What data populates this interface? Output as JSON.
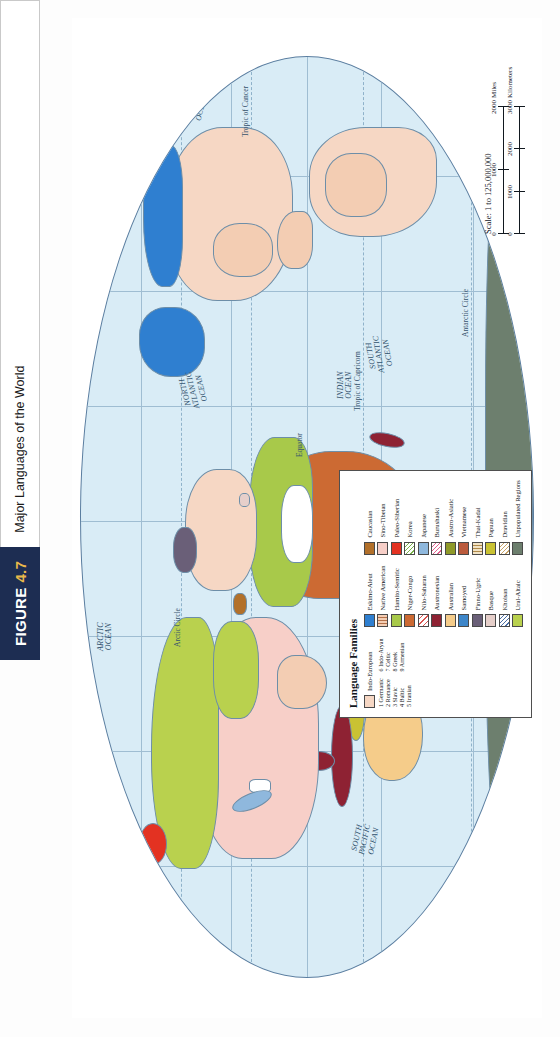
{
  "figure": {
    "tag_word": "FIGURE",
    "tag_number": "4.7",
    "caption": "Major Languages of the World"
  },
  "map": {
    "projection_note": "oval world projection",
    "ocean_labels": [
      {
        "name": "north-pacific-ocean-west",
        "text": "NORTH\nPACIFIC\nOCEAN",
        "x": 155,
        "y": 40
      },
      {
        "name": "arctic-ocean",
        "text": "ARCTIC\nOCEAN",
        "x": 348,
        "y": 22
      },
      {
        "name": "north-atlantic-ocean",
        "text": "NORTH\nATLANTIC\nOCEAN",
        "x": 592,
        "y": 108
      },
      {
        "name": "north-pacific-ocean-east",
        "text": "NORTH\nPACIFIC\nOCEAN",
        "x": 823,
        "y": 104
      },
      {
        "name": "indian-ocean",
        "text": "INDIAN\nOCEAN",
        "x": 300,
        "y": 262
      },
      {
        "name": "south-pacific-ocean",
        "text": "SOUTH\nPACIFIC\nOCEAN",
        "x": 138,
        "y": 276
      },
      {
        "name": "south-atlantic-ocean",
        "text": "SOUTH\nATLANTIC\nOCEAN",
        "x": 512,
        "y": 276
      }
    ],
    "lines": [
      {
        "name": "arctic-circle",
        "text": "Arctic Circle",
        "x": 318,
        "y": 108
      },
      {
        "name": "tropic-of-cancer",
        "text": "Tropic of Cancer",
        "x": 175,
        "y": 172
      },
      {
        "name": "equator",
        "text": "Equator",
        "x": 347,
        "y": 222
      },
      {
        "name": "tropic-of-capricorn",
        "text": "Tropic of Capricorn",
        "x": 247,
        "y": 272
      },
      {
        "name": "antarctic-circle",
        "text": "Antarctic Circle",
        "x": 197,
        "y": 392
      }
    ]
  },
  "scale": {
    "statement": "Scale: 1 to 125,000,000",
    "miles": {
      "unit": "Miles",
      "ticks": [
        "0",
        "1000",
        "2000"
      ]
    },
    "kilometers": {
      "unit": "Kilometers",
      "ticks": [
        "0",
        "1000",
        "2000",
        "3000"
      ]
    }
  },
  "legend": {
    "title": "Language Families",
    "column1": [
      {
        "label": "Indo-European",
        "color": "#f6d7c4",
        "pattern": "solid"
      }
    ],
    "indo_european_numbered": {
      "left": [
        "1  Germanic",
        "2  Romance",
        "3  Slavic",
        "4  Baltic",
        "5  Iranian"
      ],
      "right": [
        "6  Indo-Aryan",
        "7  Celtic",
        "8  Greek",
        "9  Armenian"
      ]
    },
    "column2": [
      {
        "label": "Eskimo-Aleut",
        "color": "#2f7fd0",
        "pattern": "solid"
      },
      {
        "label": "Native American",
        "color": "#f3cdb3",
        "pattern": "vstripe"
      },
      {
        "label": "Hamito-Semitic",
        "color": "#a8c94a",
        "pattern": "solid"
      },
      {
        "label": "Niger-Congo",
        "color": "#cc6a33",
        "pattern": "solid"
      },
      {
        "label": "Nilo-Saharan",
        "color": "#ffffff",
        "pattern": "diag-red"
      },
      {
        "label": "Austronesian",
        "color": "#8e2233",
        "pattern": "solid"
      },
      {
        "label": "Australian",
        "color": "#f5cc8a",
        "pattern": "solid"
      },
      {
        "label": "Samoyed",
        "color": "#3d86c9",
        "pattern": "solid"
      },
      {
        "label": "Finno-Ugric",
        "color": "#6a5f78",
        "pattern": "solid"
      },
      {
        "label": "Basque",
        "color": "#e6cfca",
        "pattern": "solid"
      },
      {
        "label": "Khoisan",
        "color": "#ffffff",
        "pattern": "diag-blue"
      },
      {
        "label": "Ural-Altaic",
        "color": "#b9d14e",
        "pattern": "solid"
      }
    ],
    "column3": [
      {
        "label": "Caucasian",
        "color": "#b2702a",
        "pattern": "solid"
      },
      {
        "label": "Sino-Tibetan",
        "color": "#f7cfc8",
        "pattern": "solid"
      },
      {
        "label": "Paleo-Siberian",
        "color": "#e33222",
        "pattern": "solid"
      },
      {
        "label": "Korea",
        "color": "#ffffff",
        "pattern": "diag-green"
      },
      {
        "label": "Japanese",
        "color": "#8fb8dd",
        "pattern": "solid"
      },
      {
        "label": "Burushaski",
        "color": "#ffffff",
        "pattern": "diag-pink"
      },
      {
        "label": "Austro-Asiatic",
        "color": "#8f9a2a",
        "pattern": "solid"
      },
      {
        "label": "Vietnamese",
        "color": "#bb5b3d",
        "pattern": "solid"
      },
      {
        "label": "Thai-Kadai",
        "color": "#f1e2c4",
        "pattern": "vstripe"
      },
      {
        "label": "Papuan",
        "color": "#c9c233",
        "pattern": "solid"
      },
      {
        "label": "Dravidian",
        "color": "#ffffff",
        "pattern": "diag-tan"
      },
      {
        "label": "Unpopulated Regions",
        "color": "#6d7f6e",
        "pattern": "solid"
      }
    ]
  },
  "colors": {
    "ocean": "#d9ecf6",
    "graticule": "#9fbdd2",
    "figure_tag_bg": "#1d2d52",
    "figure_tag_accent": "#e9b84a",
    "coastline": "#6d8ea8"
  }
}
